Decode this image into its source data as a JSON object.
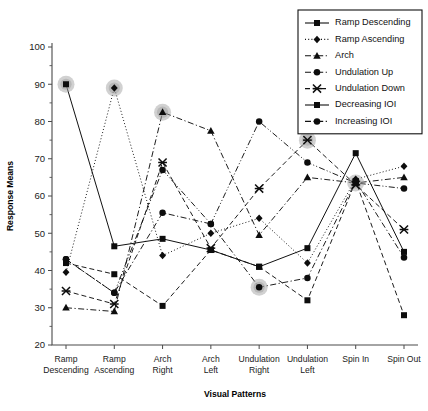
{
  "chart_data": {
    "type": "line",
    "title": "",
    "xlabel": "Visual Patterns",
    "ylabel": "Response Means",
    "ylim": [
      20,
      100
    ],
    "yticks": [
      20,
      30,
      40,
      50,
      60,
      70,
      80,
      90,
      100
    ],
    "grid": false,
    "legend_position": "top-right",
    "categories": [
      "Ramp Descending",
      "Ramp Ascending",
      "Arch Right",
      "Arch Left",
      "Undulation Right",
      "Undulation Left",
      "Spin In",
      "Spin Out"
    ],
    "category_lines": [
      [
        "Ramp",
        "Descending"
      ],
      [
        "Ramp",
        "Ascending"
      ],
      [
        "Arch",
        "Right"
      ],
      [
        "Arch",
        "Left"
      ],
      [
        "Undulation",
        "Right"
      ],
      [
        "Undulation",
        "Left"
      ],
      [
        "Spin In",
        ""
      ],
      [
        "Spin Out",
        ""
      ]
    ],
    "series": [
      {
        "name": "Ramp Descending",
        "marker": "square",
        "dash": "solid",
        "values": [
          90,
          46.5,
          48.5,
          45.5,
          41,
          46,
          71.5,
          45
        ],
        "highlight_index": 0
      },
      {
        "name": "Ramp Ascending",
        "marker": "diamond",
        "dash": "dotted",
        "values": [
          39.5,
          89,
          44,
          50,
          54,
          42,
          64.5,
          68
        ],
        "highlight_index": 1
      },
      {
        "name": "Arch",
        "marker": "triangle",
        "dash": "dash-dot",
        "values": [
          30,
          29,
          82.5,
          77.5,
          49.5,
          65,
          63.5,
          65
        ],
        "highlight_index": 2
      },
      {
        "name": "Undulation Up",
        "marker": "circle",
        "dash": "dash-dot",
        "values": [
          43,
          34,
          55.5,
          52.5,
          35.5,
          38,
          64,
          43.5
        ],
        "highlight_index": 4
      },
      {
        "name": "Undulation Down",
        "marker": "x",
        "dash": "dashed",
        "values": [
          34.5,
          31,
          69,
          46,
          62,
          75,
          63,
          51
        ],
        "highlight_index": 5
      },
      {
        "name": "Decreasing IOI",
        "marker": "square",
        "dash": "dashed",
        "values": [
          42,
          39,
          30.5,
          45.5,
          41,
          32,
          64,
          28
        ],
        "highlight_index": -1
      },
      {
        "name": "Increasing IOI",
        "marker": "circle",
        "dash": "dash-dot-dot",
        "values": [
          43,
          34,
          67,
          52.5,
          80,
          69,
          63.5,
          62
        ],
        "highlight_index": 6
      }
    ],
    "legend_entries": [
      {
        "label": "Ramp Descending",
        "marker": "square",
        "dash": "solid"
      },
      {
        "label": "Ramp Ascending",
        "marker": "diamond",
        "dash": "dotted"
      },
      {
        "label": "Arch",
        "marker": "triangle",
        "dash": "dash-dot"
      },
      {
        "label": "Undulation Up",
        "marker": "circle",
        "dash": "dash-dot"
      },
      {
        "label": "Undulation Down",
        "marker": "x",
        "dash": "dashed"
      },
      {
        "label": "Decreasing IOI",
        "marker": "square",
        "dash": "solid"
      },
      {
        "label": "Increasing IOI",
        "marker": "circle",
        "dash": "dash-dot"
      }
    ],
    "colors": {
      "line": "#111111",
      "marker": "#0d0d0d",
      "halo": "#9a9a9a",
      "axis": "#4a4a4a",
      "background": "#ffffff"
    }
  }
}
